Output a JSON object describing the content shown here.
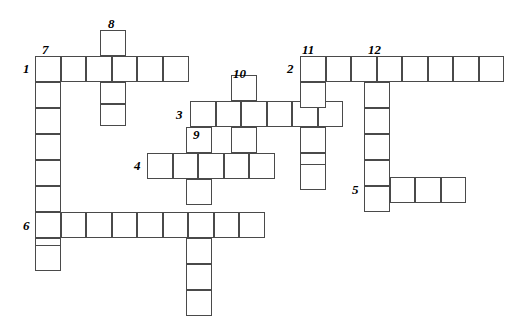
{
  "puzzle": {
    "type": "crossword-grid",
    "title": "Crossword puzzle grid",
    "width": 519,
    "height": 324,
    "cell_size": 25.5,
    "origin": {
      "x": 35,
      "y": 56
    },
    "colors": {
      "background": "#ffffff",
      "cell_fill": "#ffffff",
      "cell_border": "#4a4a4a",
      "number_text": "#000000"
    },
    "entries": [
      {
        "number": "1",
        "direction": "across",
        "length": 7,
        "row": 0,
        "col": 0
      },
      {
        "number": "1",
        "direction": "down",
        "length": 8,
        "row": 0,
        "col": 0
      },
      {
        "number": "7",
        "direction": "down",
        "length": 1,
        "row": 0,
        "col": 1
      },
      {
        "number": "8",
        "direction": "down",
        "length": 4,
        "row": -1,
        "col": 3
      },
      {
        "number": "2",
        "direction": "across",
        "length": 9,
        "row": 0,
        "col": 10.4
      },
      {
        "number": "11",
        "direction": "down",
        "length": 5,
        "row": 0,
        "col": 10.4
      },
      {
        "number": "12",
        "direction": "down",
        "length": 6,
        "row": 0,
        "col": 12.9
      },
      {
        "number": "3",
        "direction": "across",
        "length": 6,
        "row": 1.75,
        "col": 6.1
      },
      {
        "number": "10",
        "direction": "down",
        "length": 4,
        "row": 1,
        "col": 9.2
      },
      {
        "number": "9",
        "direction": "down",
        "length": 8,
        "row": 1.75,
        "col": 7.3
      },
      {
        "number": "4",
        "direction": "across",
        "length": 5,
        "row": 3.6,
        "col": 4.4
      },
      {
        "number": "5",
        "direction": "across",
        "length": 4,
        "row": 4.7,
        "col": 12.9
      },
      {
        "number": "6",
        "direction": "across",
        "length": 9,
        "row": 6.0,
        "col": 0
      }
    ],
    "cells": [
      {
        "x": 35,
        "y": 56,
        "w": 25.5,
        "h": 26
      },
      {
        "x": 60.5,
        "y": 56,
        "w": 25.5,
        "h": 26
      },
      {
        "x": 86,
        "y": 56,
        "w": 25.5,
        "h": 26
      },
      {
        "x": 111.5,
        "y": 56,
        "w": 25.5,
        "h": 26
      },
      {
        "x": 137,
        "y": 56,
        "w": 25.5,
        "h": 26
      },
      {
        "x": 162.5,
        "y": 56,
        "w": 26.5,
        "h": 26
      },
      {
        "x": 100,
        "y": 30,
        "w": 25.5,
        "h": 26
      },
      {
        "x": 100,
        "y": 82,
        "w": 25.5,
        "h": 22
      },
      {
        "x": 100,
        "y": 104,
        "w": 25.5,
        "h": 22
      },
      {
        "x": 35,
        "y": 82,
        "w": 25.5,
        "h": 26
      },
      {
        "x": 35,
        "y": 108,
        "w": 25.5,
        "h": 26
      },
      {
        "x": 35,
        "y": 134,
        "w": 25.5,
        "h": 26
      },
      {
        "x": 35,
        "y": 160,
        "w": 25.5,
        "h": 26
      },
      {
        "x": 35,
        "y": 186,
        "w": 25.5,
        "h": 26
      },
      {
        "x": 35,
        "y": 212,
        "w": 25.5,
        "h": 26
      },
      {
        "x": 35,
        "y": 238,
        "w": 25.5,
        "h": 26
      },
      {
        "x": 35,
        "y": 245,
        "w": 25.5,
        "h": 26
      },
      {
        "x": 60.5,
        "y": 212,
        "w": 25.5,
        "h": 26
      },
      {
        "x": 86,
        "y": 212,
        "w": 25.5,
        "h": 26
      },
      {
        "x": 111.5,
        "y": 212,
        "w": 25.5,
        "h": 26
      },
      {
        "x": 137,
        "y": 212,
        "w": 25.5,
        "h": 26
      },
      {
        "x": 162.5,
        "y": 212,
        "w": 25.5,
        "h": 26
      },
      {
        "x": 188,
        "y": 212,
        "w": 25.5,
        "h": 26
      },
      {
        "x": 213.5,
        "y": 212,
        "w": 25.5,
        "h": 26
      },
      {
        "x": 239,
        "y": 212,
        "w": 25.5,
        "h": 26
      },
      {
        "x": 190,
        "y": 101,
        "w": 25.5,
        "h": 26
      },
      {
        "x": 215.5,
        "y": 101,
        "w": 25.5,
        "h": 26
      },
      {
        "x": 241,
        "y": 101,
        "w": 25.5,
        "h": 26
      },
      {
        "x": 266.5,
        "y": 101,
        "w": 25.5,
        "h": 26
      },
      {
        "x": 292,
        "y": 101,
        "w": 25.5,
        "h": 26
      },
      {
        "x": 317.5,
        "y": 101,
        "w": 25.5,
        "h": 26
      },
      {
        "x": 231,
        "y": 75,
        "w": 25.5,
        "h": 26
      },
      {
        "x": 231,
        "y": 127,
        "w": 25.5,
        "h": 26
      },
      {
        "x": 231,
        "y": 153,
        "w": 25.5,
        "h": 26
      },
      {
        "x": 147,
        "y": 153,
        "w": 25.5,
        "h": 26
      },
      {
        "x": 172.5,
        "y": 153,
        "w": 25.5,
        "h": 26
      },
      {
        "x": 198,
        "y": 153,
        "w": 25.5,
        "h": 26
      },
      {
        "x": 223.5,
        "y": 153,
        "w": 25.5,
        "h": 26
      },
      {
        "x": 249,
        "y": 153,
        "w": 25.5,
        "h": 26
      },
      {
        "x": 186,
        "y": 127,
        "w": 25.5,
        "h": 26
      },
      {
        "x": 186,
        "y": 179,
        "w": 25.5,
        "h": 26
      },
      {
        "x": 186,
        "y": 238,
        "w": 25.5,
        "h": 26
      },
      {
        "x": 186,
        "y": 264,
        "w": 25.5,
        "h": 26
      },
      {
        "x": 186,
        "y": 290,
        "w": 25.5,
        "h": 26
      },
      {
        "x": 300,
        "y": 56,
        "w": 25.5,
        "h": 26
      },
      {
        "x": 325.5,
        "y": 56,
        "w": 25.5,
        "h": 26
      },
      {
        "x": 351,
        "y": 56,
        "w": 25.5,
        "h": 26
      },
      {
        "x": 376.5,
        "y": 56,
        "w": 25.5,
        "h": 26
      },
      {
        "x": 402,
        "y": 56,
        "w": 25.5,
        "h": 26
      },
      {
        "x": 427.5,
        "y": 56,
        "w": 25.5,
        "h": 26
      },
      {
        "x": 453,
        "y": 56,
        "w": 25.5,
        "h": 26
      },
      {
        "x": 478.5,
        "y": 56,
        "w": 25.5,
        "h": 26
      },
      {
        "x": 300,
        "y": 82,
        "w": 25.5,
        "h": 26
      },
      {
        "x": 300,
        "y": 127,
        "w": 25.5,
        "h": 26
      },
      {
        "x": 300,
        "y": 153,
        "w": 25.5,
        "h": 26
      },
      {
        "x": 300,
        "y": 164,
        "w": 25.5,
        "h": 26
      },
      {
        "x": 364,
        "y": 82,
        "w": 25.5,
        "h": 26
      },
      {
        "x": 364,
        "y": 108,
        "w": 25.5,
        "h": 26
      },
      {
        "x": 364,
        "y": 134,
        "w": 25.5,
        "h": 26
      },
      {
        "x": 364,
        "y": 160,
        "w": 25.5,
        "h": 26
      },
      {
        "x": 364,
        "y": 186,
        "w": 25.5,
        "h": 26
      },
      {
        "x": 389.5,
        "y": 177,
        "w": 25.5,
        "h": 26
      },
      {
        "x": 415,
        "y": 177,
        "w": 25.5,
        "h": 26
      },
      {
        "x": 440.5,
        "y": 177,
        "w": 25.5,
        "h": 26
      }
    ],
    "numbers": [
      {
        "label": "8",
        "x": 108,
        "y": 17
      },
      {
        "label": "7",
        "x": 42,
        "y": 43
      },
      {
        "label": "11",
        "x": 302,
        "y": 43
      },
      {
        "label": "12",
        "x": 368,
        "y": 43
      },
      {
        "label": "1",
        "x": 23,
        "y": 62
      },
      {
        "label": "2",
        "x": 287,
        "y": 62
      },
      {
        "label": "10",
        "x": 233,
        "y": 67
      },
      {
        "label": "3",
        "x": 176,
        "y": 108
      },
      {
        "label": "9",
        "x": 193,
        "y": 128
      },
      {
        "label": "4",
        "x": 134,
        "y": 159
      },
      {
        "label": "5",
        "x": 352,
        "y": 183
      },
      {
        "label": "6",
        "x": 23,
        "y": 219
      }
    ]
  }
}
